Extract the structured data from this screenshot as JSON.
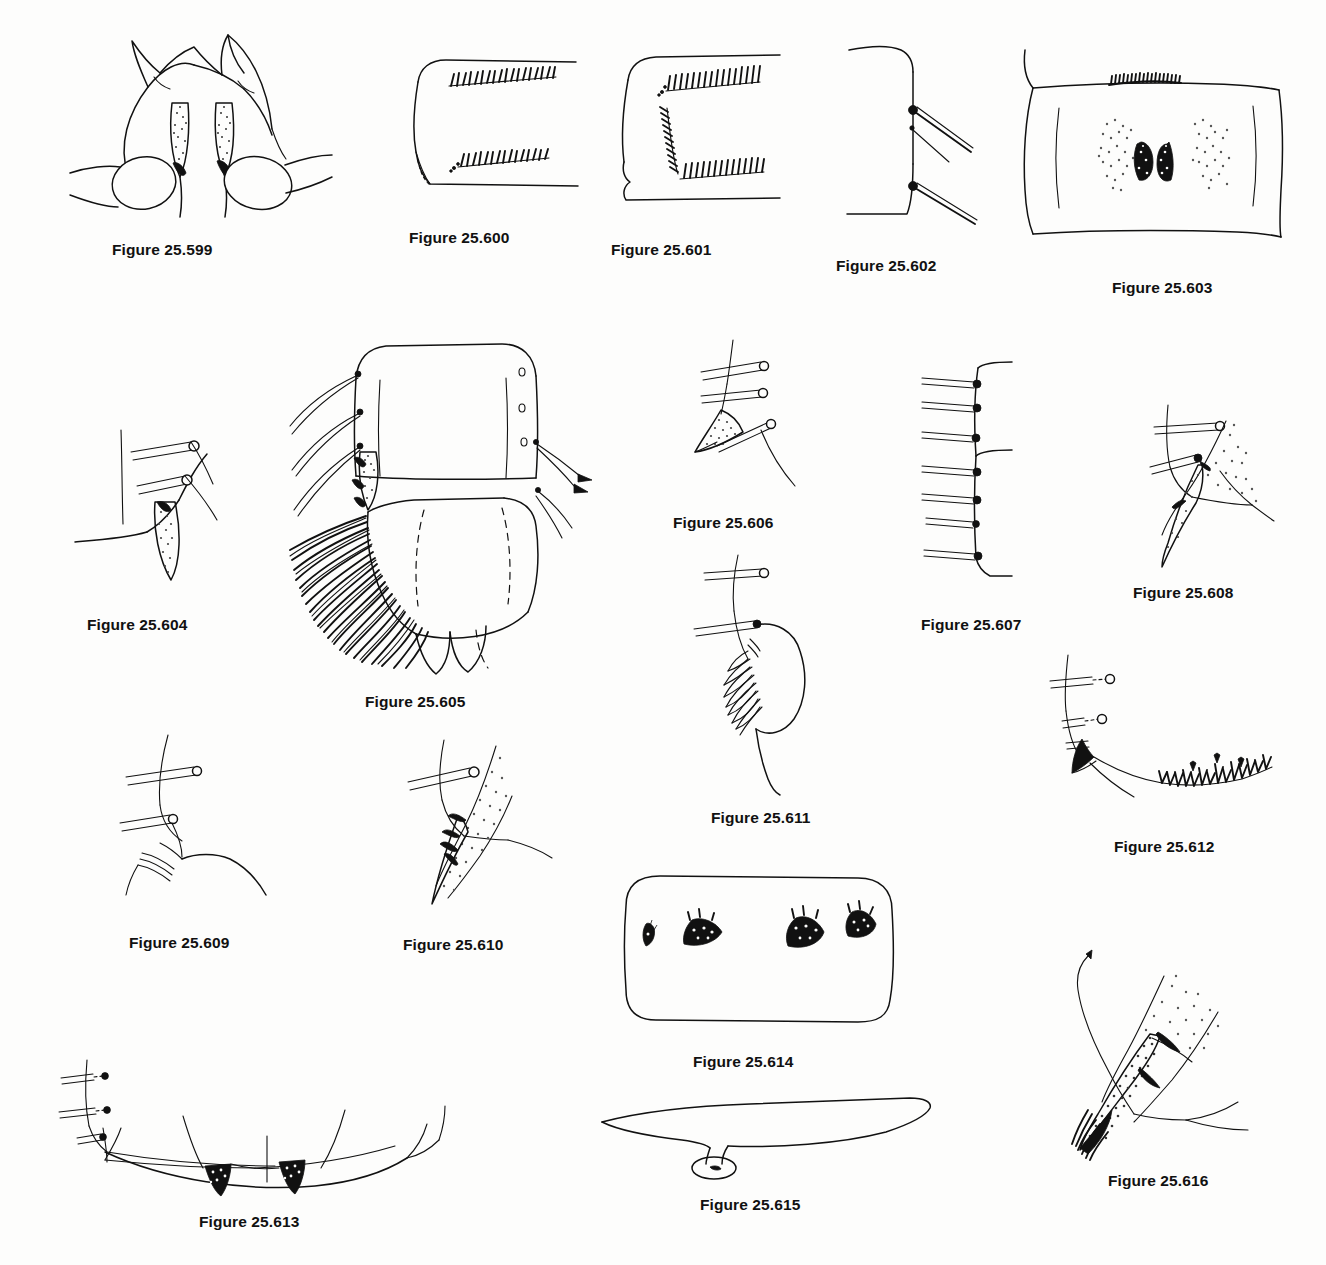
{
  "plate": {
    "page_width": 1326,
    "page_height": 1265,
    "background_color": "#fdfdfc",
    "ink_color": "#111111",
    "caption_prefix": "Figure",
    "figure_count": 18
  },
  "figures": [
    {
      "id": "25.599",
      "caption": "Figure 25.599",
      "subject": "head capsule with paired stippled mandibular teeth and rounded basal lobes",
      "caption_x": 112,
      "caption_y": 241,
      "art_x": 70,
      "art_y": 25,
      "art_w": 260,
      "art_h": 195
    },
    {
      "id": "25.600",
      "caption": "Figure 25.600",
      "subject": "rounded-square segment with two oblique rows of short dark hatch spinules",
      "caption_x": 409,
      "caption_y": 229,
      "art_x": 404,
      "art_y": 48,
      "art_w": 175,
      "art_h": 152
    },
    {
      "id": "25.601",
      "caption": "Figure 25.601",
      "subject": "rounded-square segment with L-shaped arrangement of spinule rows",
      "caption_x": 611,
      "caption_y": 241,
      "art_x": 610,
      "art_y": 46,
      "art_w": 170,
      "art_h": 165
    },
    {
      "id": "25.602",
      "caption": "Figure 25.602",
      "subject": "segment corner bearing two socketed setae and one small seta",
      "caption_x": 836,
      "caption_y": 257,
      "art_x": 845,
      "art_y": 36,
      "art_w": 140,
      "art_h": 180
    },
    {
      "id": "25.603",
      "caption": "Figure 25.603",
      "subject": "broad segment with paired dark stippled patches and a marginal spinule band",
      "caption_x": 1112,
      "caption_y": 279,
      "art_x": 1015,
      "art_y": 40,
      "art_w": 265,
      "art_h": 200
    },
    {
      "id": "25.604",
      "caption": "Figure 25.604",
      "subject": "stippled tapering claw with two socketed setae on margin",
      "caption_x": 87,
      "caption_y": 616,
      "art_x": 75,
      "art_y": 420,
      "art_w": 170,
      "art_h": 160
    },
    {
      "id": "25.605",
      "caption": "Figure 25.605",
      "subject": "terminal abdominal segments with dense lateral comb of long setae and paired apical lobes",
      "caption_x": 365,
      "caption_y": 693,
      "art_x": 300,
      "art_y": 330,
      "art_w": 300,
      "art_h": 340
    },
    {
      "id": "25.606",
      "caption": "Figure 25.606",
      "subject": "stippled triangular tooth with three socketed setae",
      "caption_x": 673,
      "caption_y": 514,
      "art_x": 665,
      "art_y": 340,
      "art_w": 140,
      "art_h": 150
    },
    {
      "id": "25.607",
      "caption": "Figure 25.607",
      "subject": "margin bearing a row of seven socketed setae",
      "caption_x": 921,
      "caption_y": 616,
      "art_x": 920,
      "art_y": 360,
      "art_w": 110,
      "art_h": 230
    },
    {
      "id": "25.608",
      "caption": "Figure 25.608",
      "subject": "stippled falcate claw with two socketed setae",
      "caption_x": 1133,
      "caption_y": 584,
      "art_x": 1120,
      "art_y": 405,
      "art_w": 150,
      "art_h": 160
    },
    {
      "id": "25.609",
      "caption": "Figure 25.609",
      "subject": "unstippled lobe with two socketed setae and fine apical fringe",
      "caption_x": 129,
      "caption_y": 934,
      "art_x": 120,
      "art_y": 735,
      "art_w": 155,
      "art_h": 160
    },
    {
      "id": "25.610",
      "caption": "Figure 25.610",
      "subject": "stippled elongate claw with dark basal denticles and one socketed seta",
      "caption_x": 403,
      "caption_y": 936,
      "art_x": 400,
      "art_y": 740,
      "art_w": 160,
      "art_h": 170
    },
    {
      "id": "25.611",
      "caption": "Figure 25.611",
      "subject": "rounded lobe with comb of curved spines and two socketed setae",
      "caption_x": 711,
      "caption_y": 809,
      "art_x": 690,
      "art_y": 555,
      "art_w": 150,
      "art_h": 235
    },
    {
      "id": "25.612",
      "caption": "Figure 25.612",
      "subject": "dark apical tooth with long curved margin bearing forked Y-shaped spinules",
      "caption_x": 1114,
      "caption_y": 838,
      "art_x": 1010,
      "art_y": 655,
      "art_w": 265,
      "art_h": 155
    },
    {
      "id": "25.613",
      "caption": "Figure 25.613",
      "subject": "broad arched sclerite with two stippled triangular median teeth and three socketed setae",
      "caption_x": 199,
      "caption_y": 1213,
      "art_x": 55,
      "art_y": 1040,
      "art_w": 390,
      "art_h": 150
    },
    {
      "id": "25.614",
      "caption": "Figure 25.614",
      "subject": "rounded rectangular plate with four small dark spinule clusters",
      "caption_x": 693,
      "caption_y": 1053,
      "art_x": 620,
      "art_y": 868,
      "art_w": 275,
      "art_h": 155
    },
    {
      "id": "25.615",
      "caption": "Figure 25.615",
      "subject": "elongate blade-like sclerite with basal stalk and ring-shaped socket",
      "caption_x": 700,
      "caption_y": 1196,
      "art_x": 600,
      "art_y": 1090,
      "art_w": 330,
      "art_h": 85
    },
    {
      "id": "25.616",
      "caption": "Figure 25.616",
      "subject": "heavily stippled claw with dark fringe of apical denticles and long curved seta",
      "caption_x": 1108,
      "caption_y": 1172,
      "art_x": 1040,
      "art_y": 950,
      "art_w": 230,
      "art_h": 205
    }
  ]
}
